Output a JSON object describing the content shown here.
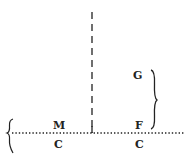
{
  "diagram": {
    "colors": {
      "ink": "#222222",
      "background": "#ffffff"
    },
    "labels": {
      "m": "M",
      "c_left": "C",
      "g": "G",
      "f": "F",
      "c_right": "C"
    },
    "elements": [
      {
        "type": "dotted-horizontal-line",
        "y": 133,
        "x_from": 12,
        "x_to": 185
      },
      {
        "type": "dashed-vertical-line",
        "x": 92,
        "y_from": 12,
        "y_to": 133
      },
      {
        "type": "left-brace",
        "x": 10,
        "y_from": 119,
        "y_to": 153,
        "opens": "right"
      },
      {
        "type": "right-brace",
        "x": 153,
        "y_from": 70,
        "y_to": 129,
        "opens": "left"
      }
    ]
  }
}
